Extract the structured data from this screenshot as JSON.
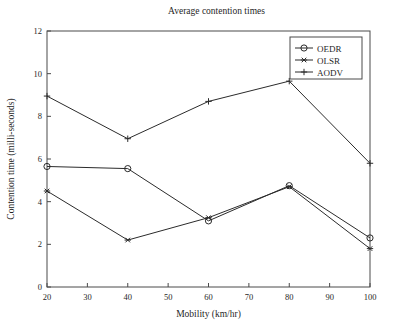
{
  "chart_data": {
    "type": "line",
    "title": "Average contention times",
    "xlabel": "Mobility (km/hr)",
    "ylabel": "Contention time (milli-seconds)",
    "x": [
      20,
      40,
      60,
      80,
      100
    ],
    "xlim": [
      20,
      100
    ],
    "ylim": [
      0,
      12
    ],
    "xticks": [
      20,
      30,
      40,
      50,
      60,
      70,
      80,
      90,
      100
    ],
    "yticks": [
      0,
      2,
      4,
      6,
      8,
      10,
      12
    ],
    "grid": false,
    "legend_position": "top-right",
    "series": [
      {
        "name": "OEDR",
        "marker": "circle",
        "values": [
          5.65,
          5.55,
          3.1,
          4.75,
          2.3
        ]
      },
      {
        "name": "OLSR",
        "marker": "star",
        "values": [
          4.5,
          2.2,
          3.25,
          4.7,
          1.8
        ]
      },
      {
        "name": "AODV",
        "marker": "plus",
        "values": [
          8.95,
          6.95,
          8.7,
          9.65,
          5.8
        ]
      }
    ],
    "colors": {
      "line": "#2b2b2b",
      "axis": "#4a4a4a",
      "text": "#1f1f1f",
      "background": "#ffffff"
    }
  }
}
